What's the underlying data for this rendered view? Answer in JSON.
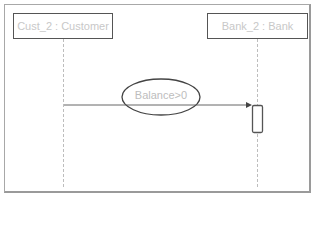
{
  "diagram": {
    "type": "uml-sequence",
    "lifelines": [
      {
        "id": "cust",
        "label": "Cust_2 : Customer"
      },
      {
        "id": "bank",
        "label": "Bank_2 : Bank"
      }
    ],
    "messages": [
      {
        "from": "cust",
        "to": "bank",
        "guard": "Balance>0"
      }
    ],
    "colors": {
      "frame": "#a8a8a8",
      "box_border": "#555555",
      "label_text": "#c8c8c8",
      "lifeline": "#bdbdbd",
      "arrow": "#555555"
    }
  }
}
